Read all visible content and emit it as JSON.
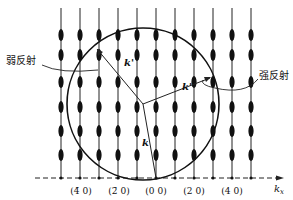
{
  "diagram": {
    "title": "",
    "callouts": {
      "weak_reflection": "弱反射",
      "strong_reflection": "强反射"
    },
    "vectors": {
      "k": "k",
      "k_prime_left": "k'",
      "k_prime_right": "k'"
    },
    "axis": {
      "label_main": "k",
      "label_sub": "x",
      "ticks": [
        "(4̄ 0)",
        "(2̄ 0)",
        "(0 0)",
        "(2 0)",
        "(4 0)"
      ]
    },
    "rods": {
      "x_positions": [
        61,
        80,
        99,
        118,
        137,
        156,
        175,
        194,
        213,
        232,
        251
      ],
      "oval_y_positions": [
        35,
        55,
        82,
        107,
        131,
        155
      ]
    },
    "ewald_circle": {
      "cx": 143,
      "cy": 104,
      "r": 76
    },
    "colors": {
      "ink": "#111111",
      "background": "#ffffff"
    }
  }
}
